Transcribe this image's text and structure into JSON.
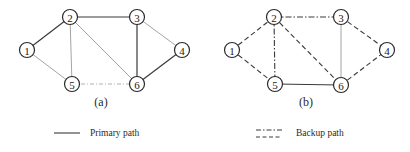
{
  "diagrams": [
    {
      "id": "a",
      "caption": "(a)",
      "caption_pos": [
        101,
        106
      ],
      "nodes": [
        {
          "id": "1",
          "label": "1",
          "x": 27,
          "y": 50
        },
        {
          "id": "2",
          "label": "2",
          "x": 70,
          "y": 17
        },
        {
          "id": "3",
          "label": "3",
          "x": 137,
          "y": 17
        },
        {
          "id": "4",
          "label": "4",
          "x": 182,
          "y": 50
        },
        {
          "id": "5",
          "label": "5",
          "x": 72,
          "y": 84
        },
        {
          "id": "6",
          "label": "6",
          "x": 137,
          "y": 84
        }
      ],
      "edges": [
        {
          "from": "1",
          "to": "2",
          "style": "primary"
        },
        {
          "from": "2",
          "to": "3",
          "style": "primary"
        },
        {
          "from": "3",
          "to": "6",
          "style": "primary"
        },
        {
          "from": "6",
          "to": "4",
          "style": "primary"
        },
        {
          "from": "1",
          "to": "5",
          "style": "light"
        },
        {
          "from": "2",
          "to": "5",
          "style": "light"
        },
        {
          "from": "2",
          "to": "6",
          "style": "light"
        },
        {
          "from": "3",
          "to": "4",
          "style": "light"
        },
        {
          "from": "5",
          "to": "6",
          "style": "light-dashdot"
        }
      ]
    },
    {
      "id": "b",
      "caption": "(b)",
      "caption_pos": [
        306,
        106
      ],
      "nodes": [
        {
          "id": "1",
          "label": "1",
          "x": 232,
          "y": 50
        },
        {
          "id": "2",
          "label": "2",
          "x": 274,
          "y": 17
        },
        {
          "id": "3",
          "label": "3",
          "x": 341,
          "y": 17
        },
        {
          "id": "4",
          "label": "4",
          "x": 387,
          "y": 50
        },
        {
          "id": "5",
          "label": "5",
          "x": 275,
          "y": 84
        },
        {
          "id": "6",
          "label": "6",
          "x": 341,
          "y": 85
        }
      ],
      "edges": [
        {
          "from": "1",
          "to": "2",
          "style": "dashed"
        },
        {
          "from": "1",
          "to": "5",
          "style": "dashed"
        },
        {
          "from": "2",
          "to": "3",
          "style": "dashdot"
        },
        {
          "from": "2",
          "to": "5",
          "style": "dashdot"
        },
        {
          "from": "2",
          "to": "6",
          "style": "dashed"
        },
        {
          "from": "3",
          "to": "4",
          "style": "dashed"
        },
        {
          "from": "6",
          "to": "4",
          "style": "dashed"
        },
        {
          "from": "3",
          "to": "6",
          "style": "light"
        },
        {
          "from": "5",
          "to": "6",
          "style": "primary"
        }
      ]
    }
  ],
  "edge_styles": {
    "primary": {
      "color": "#3a3a3a",
      "width": 1.2,
      "dash": ""
    },
    "light": {
      "color": "#9a9a9a",
      "width": 0.9,
      "dash": ""
    },
    "light-dashdot": {
      "color": "#a8a8a8",
      "width": 0.9,
      "dash": "4 2 1 2"
    },
    "dashed": {
      "color": "#3a3a3a",
      "width": 1.1,
      "dash": "5 3"
    },
    "dashdot": {
      "color": "#3a3a3a",
      "width": 1.1,
      "dash": "6 2 1.5 2"
    }
  },
  "legend": {
    "primary": {
      "label": "Primary path",
      "line": [
        [
          54,
          133
        ],
        [
          80,
          133
        ]
      ],
      "text_pos": [
        90,
        136
      ]
    },
    "backup": {
      "label": "Backup path",
      "lines": [
        [
          [
            256,
            130
          ],
          [
            282,
            130
          ],
          "dashdot"
        ],
        [
          [
            256,
            137
          ],
          [
            282,
            137
          ],
          "dashed"
        ]
      ],
      "text_pos": [
        296,
        136
      ]
    }
  }
}
